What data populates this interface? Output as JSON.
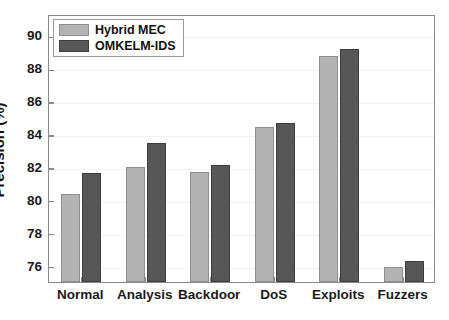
{
  "chart_data": {
    "type": "bar",
    "title": "",
    "xlabel": "",
    "ylabel": "Precision (%)",
    "categories": [
      "Normal",
      "Analysis",
      "Backdoor",
      "DoS",
      "Exploits",
      "Fuzzers"
    ],
    "series": [
      {
        "name": "Hybrid MEC",
        "color": "#b3b3b3",
        "values": [
          80.35,
          82.0,
          81.7,
          84.45,
          88.75,
          75.9
        ]
      },
      {
        "name": "OMKELM-IDS",
        "color": "#575757",
        "values": [
          81.65,
          83.45,
          82.1,
          84.7,
          89.2,
          76.3
        ]
      }
    ],
    "ylim": [
      75.0,
      91.3
    ],
    "yticks": [
      76,
      78,
      80,
      82,
      84,
      86,
      88,
      90
    ],
    "ytick_labels": [
      "76",
      "78",
      "80",
      "82",
      "84",
      "86",
      "88",
      "90"
    ],
    "grid": true,
    "legend_position": "upper left"
  },
  "legend": {
    "entries": [
      {
        "label": "Hybrid MEC"
      },
      {
        "label": "OMKELM-IDS"
      }
    ]
  },
  "caption": {
    "text": ""
  }
}
